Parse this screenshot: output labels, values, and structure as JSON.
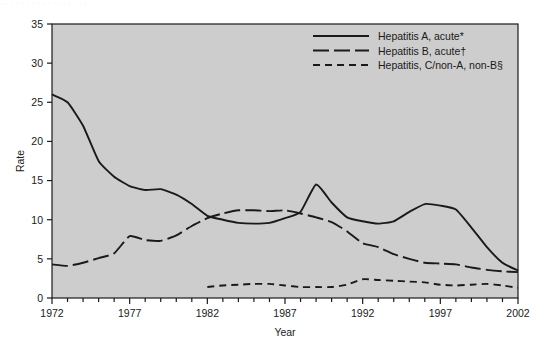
{
  "figure": {
    "background_color": "#ffffff",
    "plot_background_color": "#cdcdcd",
    "line_color": "#1a1a1a",
    "faint_top_text": "· ·  ·  ·   ·  ·   ·  ·  ·  ·  ·  ·   ·   ·  ·  ·  ·"
  },
  "chart_data": {
    "type": "line",
    "title": "",
    "xlabel": "Year",
    "ylabel": "Rate",
    "xlim": [
      1972,
      2002
    ],
    "ylim": [
      0,
      35
    ],
    "ytick_step": 5,
    "yticks": [
      0,
      5,
      10,
      15,
      20,
      25,
      30,
      35
    ],
    "xticks_major": [
      1972,
      1977,
      1982,
      1987,
      1992,
      1997,
      2002
    ],
    "xticks_minor_step": 1,
    "grid": false,
    "legend_position": "top-right",
    "x": [
      1972,
      1973,
      1974,
      1975,
      1976,
      1977,
      1978,
      1979,
      1980,
      1981,
      1982,
      1983,
      1984,
      1985,
      1986,
      1987,
      1988,
      1989,
      1990,
      1991,
      1992,
      1993,
      1994,
      1995,
      1996,
      1997,
      1998,
      1999,
      2000,
      2001,
      2002
    ],
    "series": [
      {
        "name": "Hepatitis A, acute*",
        "style": "solid",
        "values": [
          26.0,
          25.0,
          22.0,
          17.5,
          15.5,
          14.3,
          13.8,
          13.9,
          13.2,
          12.0,
          10.5,
          10.0,
          9.6,
          9.5,
          9.6,
          10.2,
          11.0,
          14.5,
          12.2,
          10.3,
          9.8,
          9.5,
          9.8,
          11.0,
          12.0,
          11.8,
          11.3,
          9.0,
          6.5,
          4.5,
          3.5
        ]
      },
      {
        "name": "Hepatitis B, acute†",
        "style": "longdash",
        "values": [
          4.3,
          4.1,
          4.5,
          5.1,
          5.7,
          7.9,
          7.4,
          7.3,
          8.0,
          9.2,
          10.2,
          10.8,
          11.2,
          11.2,
          11.1,
          11.2,
          10.8,
          10.3,
          9.7,
          8.5,
          7.0,
          6.5,
          5.6,
          5.0,
          4.5,
          4.4,
          4.3,
          3.9,
          3.6,
          3.4,
          3.3
        ]
      },
      {
        "name": "Hepatitis, C/non-A, non-B§",
        "style": "shortdash",
        "values": [
          null,
          null,
          null,
          null,
          null,
          null,
          null,
          null,
          null,
          null,
          1.4,
          1.6,
          1.7,
          1.8,
          1.8,
          1.6,
          1.4,
          1.4,
          1.4,
          1.7,
          2.4,
          2.3,
          2.2,
          2.1,
          2.0,
          1.7,
          1.6,
          1.7,
          1.8,
          1.6,
          1.3
        ]
      }
    ]
  },
  "legend": {
    "items": [
      {
        "label": "Hepatitis A, acute*",
        "style": "solid"
      },
      {
        "label": "Hepatitis B, acute†",
        "style": "longdash"
      },
      {
        "label": "Hepatitis, C/non-A, non-B§",
        "style": "shortdash"
      }
    ]
  },
  "axes": {
    "y_title": "Rate",
    "x_title": "Year"
  }
}
